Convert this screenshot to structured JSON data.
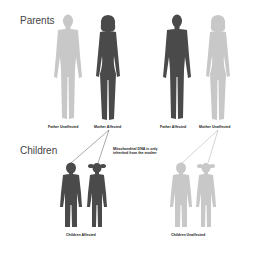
{
  "sections": {
    "parents": "Parents",
    "children": "Children"
  },
  "parents": [
    {
      "label": "Father Unaffected",
      "affected": false
    },
    {
      "label": "Mother Affected",
      "affected": true
    },
    {
      "label": "Father Affected",
      "affected": true
    },
    {
      "label": "Mother Unaffected",
      "affected": false
    }
  ],
  "children": [
    {
      "label": "Children Affected",
      "affected": true
    },
    {
      "label": "Children Unaffected",
      "affected": false
    }
  ],
  "note": {
    "line1": "Mitochondrial DNA is only",
    "line2": "inherited from the mother"
  },
  "colors": {
    "affected": "#4a4a4a",
    "unaffected": "#c8c8c8",
    "line": "#555555"
  }
}
